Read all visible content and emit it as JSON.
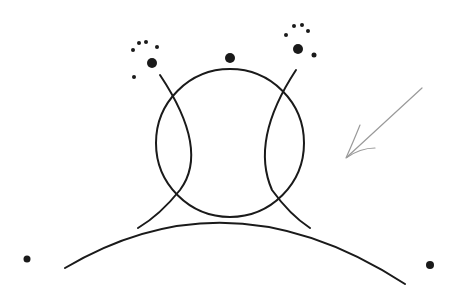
{
  "diagram": {
    "type": "hand-drawn sketch",
    "background": "#ffffff",
    "ink_color": "#1a1a1a",
    "pencil_color": "#9a9a9a",
    "elements": {
      "central_circle": {
        "cx": 230,
        "cy": 143,
        "r": 74
      },
      "ground_arc": {
        "start": [
          65,
          268
        ],
        "control": [
          230,
          170
        ],
        "end": [
          405,
          284
        ]
      },
      "left_arc": {
        "path": "M160,75 Q210,150 180,190 Q160,215 138,228"
      },
      "right_arc": {
        "path": "M296,70 Q250,140 272,190 Q290,215 310,228"
      },
      "center_dot": {
        "cx": 230,
        "cy": 58,
        "r": 5
      },
      "left_cluster": {
        "big": {
          "cx": 152,
          "cy": 63,
          "r": 5
        },
        "small": [
          [
            133,
            50
          ],
          [
            139,
            43
          ],
          [
            146,
            42
          ],
          [
            157,
            47
          ],
          [
            134,
            77
          ]
        ]
      },
      "right_cluster": {
        "big": {
          "cx": 298,
          "cy": 49,
          "r": 5
        },
        "small": [
          [
            286,
            35
          ],
          [
            294,
            26
          ],
          [
            302,
            25
          ],
          [
            308,
            31
          ],
          [
            314,
            55
          ]
        ]
      },
      "far_dots": [
        [
          27,
          259
        ],
        [
          430,
          265
        ]
      ],
      "arrow": {
        "shaft": "M422,88 L347,157",
        "head": "M360,125 Q354,140 346,158 Q360,148 375,148"
      }
    }
  }
}
